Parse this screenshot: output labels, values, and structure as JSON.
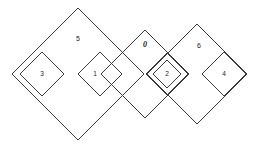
{
  "figure": {
    "type": "venn-diamond-diagram",
    "width": 261,
    "height": 147,
    "background_color": "#ffffff",
    "stroke_color": "#3a3a3a",
    "text_color": "#1a1a1a",
    "shapes": [
      {
        "id": "region-5",
        "label": "5",
        "role": "large-outer-diamond-left",
        "cx": 78,
        "cy": 74,
        "r": 66,
        "label_x": 78,
        "label_y": 39,
        "double_border": false
      },
      {
        "id": "region-3",
        "label": "3",
        "role": "small-inner-diamond",
        "cx": 42,
        "cy": 74,
        "r": 22,
        "label_x": 42,
        "label_y": 74,
        "double_border": false
      },
      {
        "id": "region-1",
        "label": "1",
        "role": "small-inner-diamond",
        "cx": 100,
        "cy": 74,
        "r": 22,
        "label_x": 95,
        "label_y": 74,
        "double_border": false
      },
      {
        "id": "region-0",
        "label": "0",
        "role": "medium-middle-diamond",
        "cx": 145,
        "cy": 74,
        "r": 44,
        "label_x": 145,
        "label_y": 45,
        "double_border": false
      },
      {
        "id": "region-2",
        "label": "2",
        "role": "small-inner-diamond-double-border",
        "cx": 167,
        "cy": 74,
        "r": 21,
        "label_x": 167,
        "label_y": 74,
        "double_border": true,
        "inner_r": 14
      },
      {
        "id": "region-6",
        "label": "6",
        "role": "large-outer-diamond-right",
        "cx": 197,
        "cy": 74,
        "r": 50,
        "label_x": 199,
        "label_y": 46,
        "double_border": false
      },
      {
        "id": "region-4",
        "label": "4",
        "role": "small-inner-diamond",
        "cx": 224,
        "cy": 74,
        "r": 22,
        "label_x": 224,
        "label_y": 74,
        "double_border": false
      }
    ]
  }
}
